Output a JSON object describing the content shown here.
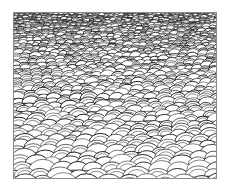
{
  "image": {
    "subject": "scale-pattern texture",
    "description": "Overlapping semicircular scale arcs in black ink on white, smaller and denser toward the top (perspective)",
    "colors": {
      "background": "#ffffff",
      "stroke": "#1a1a1a",
      "frame": "#8a8a8a"
    }
  }
}
